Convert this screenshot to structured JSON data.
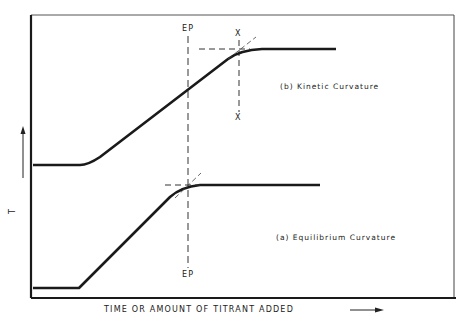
{
  "diagram": {
    "type": "titration-curve-schematic",
    "x_axis_label": "TIME  OR  AMOUNT  OF  TITRANT  ADDED",
    "y_axis_label": "T",
    "curves": [
      {
        "id": "b",
        "label": "(b)  Kinetic  Curvature",
        "description": "Curve flattens after the endpoint; extrapolation intersection marked at X-X, past EP"
      },
      {
        "id": "a",
        "label": "(a)  Equilibrium  Curvature",
        "description": "Curve flattens at endpoint; extrapolation intersection lies on EP line"
      }
    ],
    "markers": {
      "ep_top": "EP",
      "ep_bottom": "EP",
      "x_top": "X",
      "x_bottom": "X"
    },
    "colors": {
      "line": "#1a1a1a",
      "dashed": "#333333",
      "background": "#ffffff"
    }
  }
}
